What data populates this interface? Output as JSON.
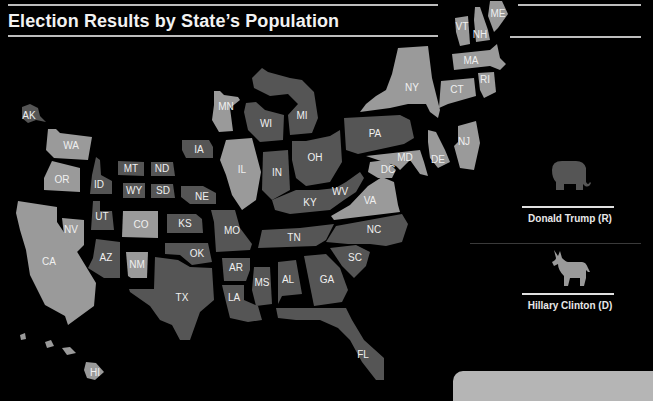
{
  "header": {
    "title": "Election Results by State’s Population"
  },
  "legend": {
    "items": [
      {
        "party": "R",
        "label": "Donald Trump (R)",
        "icon": "elephant-icon",
        "color": "#555555"
      },
      {
        "party": "D",
        "label": "Hillary Clinton (D)",
        "icon": "donkey-icon",
        "color": "#9a9a9a"
      }
    ]
  },
  "map": {
    "background": "#000000",
    "states": {
      "AK": "R",
      "HI": "D",
      "WA": "D",
      "OR": "D",
      "CA": "D",
      "NV": "D",
      "ID": "R",
      "MT": "R",
      "WY": "R",
      "UT": "R",
      "AZ": "R",
      "CO": "D",
      "NM": "D",
      "ND": "R",
      "SD": "R",
      "NE": "R",
      "KS": "R",
      "OK": "R",
      "TX": "R",
      "MN": "D",
      "IA": "R",
      "MO": "R",
      "AR": "R",
      "LA": "R",
      "WI": "R",
      "IL": "D",
      "MI": "R",
      "IN": "R",
      "OH": "R",
      "KY": "R",
      "TN": "R",
      "MS": "R",
      "AL": "R",
      "GA": "R",
      "FL": "R",
      "SC": "R",
      "NC": "R",
      "VA": "D",
      "WV": "R",
      "PA": "R",
      "NY": "D",
      "VT": "D",
      "NH": "D",
      "ME": "D",
      "MA": "D",
      "CT": "D",
      "RI": "D",
      "NJ": "D",
      "DE": "D",
      "MD": "D",
      "DC": "D"
    }
  }
}
